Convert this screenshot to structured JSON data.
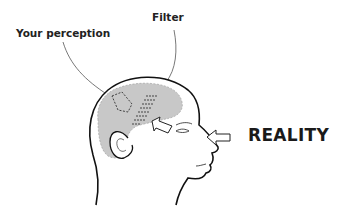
{
  "labels": {
    "perception": "Your perception",
    "filter": "Filter",
    "reality": "REALITY"
  },
  "colors": {
    "brain": "#c8c8c8",
    "outline": "#111111",
    "text": "#222222",
    "background": "#ffffff"
  },
  "icons": {
    "incoming_arrow": "left-arrow-outline",
    "inner_arrow": "up-left-arrow-outline"
  }
}
